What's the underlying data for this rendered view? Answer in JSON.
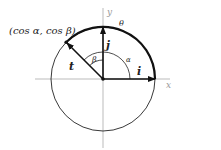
{
  "diagram": {
    "type": "unit-circle-vectors",
    "axes": {
      "x_label": "x",
      "y_label": "y"
    },
    "point_label": "(cos α, cos β)",
    "vectors": [
      {
        "name": "i",
        "label": "i",
        "direction": "along x-axis"
      },
      {
        "name": "j",
        "label": "j",
        "direction": "along y-axis"
      },
      {
        "name": "t",
        "label": "t",
        "direction": "to point on circle"
      }
    ],
    "angles": {
      "alpha": "α",
      "beta": "β",
      "theta": "θ"
    },
    "colors": {
      "line": "#111111",
      "axis": "#999999",
      "text": "#222222"
    }
  }
}
